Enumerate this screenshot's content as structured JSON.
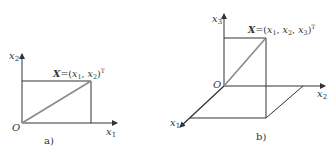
{
  "panel_a": {
    "caption": "a)",
    "axis_x_label": "x",
    "axis_x_sub": "1",
    "axis_y_label": "x",
    "axis_y_sub": "2",
    "origin_label": "O",
    "vector": {
      "name": "X",
      "eq": "=(",
      "c1": "x",
      "c1_sub": "1",
      "sep1": ", ",
      "c2": "x",
      "c2_sub": "2",
      "close": ")",
      "sup": "T"
    }
  },
  "panel_b": {
    "caption": "b)",
    "axis_1_label": "x",
    "axis_1_sub": "1",
    "axis_2_label": "x",
    "axis_2_sub": "2",
    "axis_3_label": "x",
    "axis_3_sub": "3",
    "origin_label": "O",
    "vector": {
      "name": "X",
      "eq": "=(",
      "c1": "x",
      "c1_sub": "1",
      "sep1": ", ",
      "c2": "x",
      "c2_sub": "2",
      "sep2": ", ",
      "c3": "x",
      "c3_sub": "3",
      "close": ")",
      "sup": "T"
    }
  },
  "colors": {
    "line": "#333333",
    "diagonal": "#8a8a8a",
    "text": "#333333"
  }
}
